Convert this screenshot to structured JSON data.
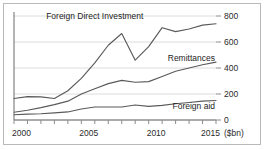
{
  "chart_data": {
    "type": "line",
    "title": "",
    "subtitle": "",
    "xlabel": "",
    "ylabel": "",
    "unit_label": "($bn)",
    "grid": true,
    "legend_position": "inline-labels",
    "xlim": [
      2000,
      2015
    ],
    "ylim": [
      0,
      800
    ],
    "x": [
      2000,
      2001,
      2002,
      2003,
      2004,
      2005,
      2006,
      2007,
      2008,
      2009,
      2010,
      2011,
      2012,
      2013,
      2014,
      2015
    ],
    "x_tick_labels": [
      "2000",
      "2005",
      "2010",
      "2015"
    ],
    "x_tick_values": [
      2000,
      2005,
      2010,
      2015
    ],
    "y_tick_labels": [
      "0",
      "200",
      "400",
      "600",
      "800"
    ],
    "y_tick_values": [
      0,
      200,
      400,
      600,
      800
    ],
    "series": [
      {
        "name": "Foreign Direct Investment",
        "label": "Foreign Direct Investment",
        "color": "#5a5a5a",
        "values": [
          165,
          180,
          178,
          165,
          225,
          320,
          440,
          575,
          665,
          460,
          565,
          710,
          680,
          700,
          730,
          740
        ]
      },
      {
        "name": "Remittances",
        "label": "Remittances",
        "color": "#5a5a5a",
        "values": [
          60,
          75,
          95,
          118,
          145,
          200,
          240,
          280,
          305,
          290,
          295,
          335,
          375,
          400,
          425,
          445
        ]
      },
      {
        "name": "Foreign aid",
        "label": "Foreign aid",
        "color": "#5a5a5a",
        "values": [
          40,
          45,
          48,
          55,
          62,
          85,
          100,
          100,
          100,
          115,
          105,
          112,
          125,
          135,
          145,
          150
        ]
      }
    ],
    "annotations": [
      {
        "name": "fdi-label",
        "text": "Foreign Direct Investment",
        "x": 2006.0,
        "y": 800
      },
      {
        "name": "remittances-label",
        "text": "Remittances",
        "x": 2011.4,
        "y": 480
      },
      {
        "name": "foreign-aid-label",
        "text": "Foreign aid",
        "x": 2011.8,
        "y": 105
      }
    ]
  },
  "colors": {
    "line": "#5a5a5a",
    "grid": "#dcdcdc",
    "axis": "#6b6b6b",
    "text": "#2b2b2b",
    "frame": "#b9b9b9",
    "background": "#ffffff"
  }
}
